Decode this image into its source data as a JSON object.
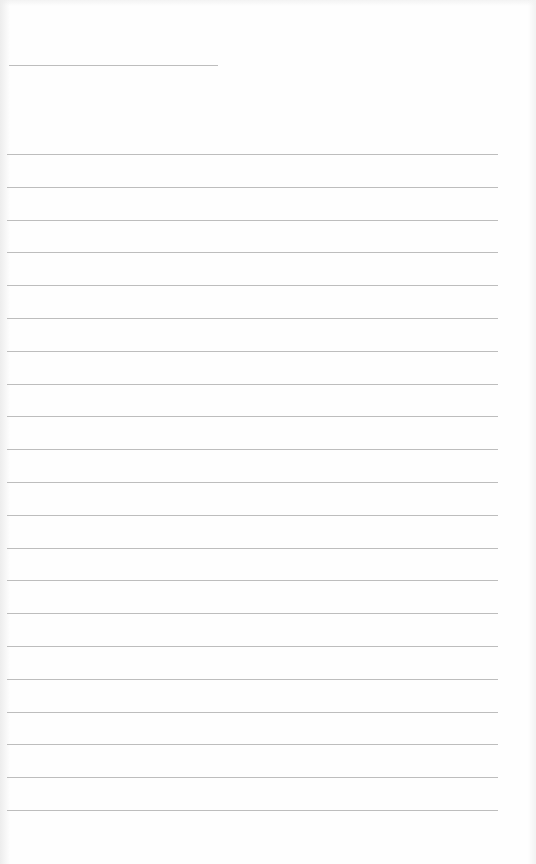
{
  "document": {
    "type": "lined-paper",
    "background_color": "#fefefe",
    "line_color": "#bdbdbd",
    "header_line": {
      "y": 65,
      "x_start": 9,
      "x_end": 218
    },
    "ruled_lines": {
      "count": 21,
      "first_y": 154,
      "spacing": 32.8,
      "x_start": 7,
      "x_end": 498
    }
  }
}
